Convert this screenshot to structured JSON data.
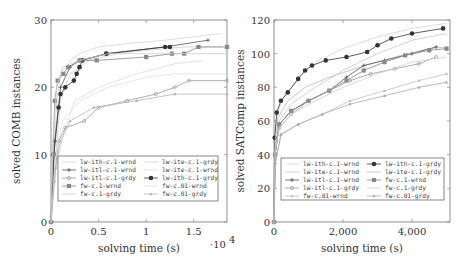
{
  "chart_data": [
    {
      "type": "line",
      "title": "",
      "xlabel": "solving time (s)",
      "ylabel": "solved COMB instances",
      "x_scale_note": "·10^4",
      "xlim": [
        0,
        1.85
      ],
      "ylim": [
        0,
        30
      ],
      "x_ticks": [
        "0",
        "0.5",
        "1",
        "1.5"
      ],
      "y_ticks": [
        "0",
        "10",
        "20",
        "30"
      ],
      "grid": false,
      "legend_position": "lower center inside",
      "legend": [
        "lw-ith-c.1-wrnd",
        "lw-ite-c.1-grdy",
        "lw-itl-c.1-wrnd",
        "lw-ite-c.1-wrnd",
        "lw-itl-c.1-grdy",
        "lw-ith-c.1-grdy",
        "fw-c.1-wrnd",
        "fw-c.01-wrnd",
        "fw-c.1-grdy",
        "fw-c.01-grdy"
      ],
      "x_unit": "x10^4 s",
      "series": [
        {
          "name": "lw-ith-c.1-wrnd",
          "color": "#d6d6d6",
          "marker": "none",
          "points": [
            [
              0,
              0
            ],
            [
              0.03,
              10
            ],
            [
              0.06,
              18
            ],
            [
              0.1,
              22
            ],
            [
              0.2,
              24
            ],
            [
              0.3,
              25
            ],
            [
              0.5,
              26
            ],
            [
              0.8,
              26.5
            ],
            [
              1.2,
              27
            ],
            [
              1.5,
              27.5
            ],
            [
              1.8,
              28
            ]
          ]
        },
        {
          "name": "lw-ite-c.1-grdy",
          "color": "#cfcfcf",
          "marker": "none",
          "points": [
            [
              0,
              0
            ],
            [
              0.05,
              10
            ],
            [
              0.1,
              18
            ],
            [
              0.2,
              22
            ],
            [
              0.4,
              24
            ],
            [
              0.7,
              25
            ],
            [
              1.0,
              25.5
            ],
            [
              1.4,
              26
            ],
            [
              1.8,
              26
            ]
          ]
        },
        {
          "name": "lw-itl-c.1-wrnd",
          "color": "#555555",
          "marker": "plus",
          "points": [
            [
              0,
              0
            ],
            [
              0.04,
              12
            ],
            [
              0.1,
              20
            ],
            [
              0.2,
              23
            ],
            [
              0.3,
              24
            ],
            [
              0.6,
              25
            ],
            [
              1.2,
              26
            ],
            [
              1.65,
              27
            ]
          ]
        },
        {
          "name": "lw-ite-c.1-wrnd",
          "color": "#dcdcdc",
          "marker": "none",
          "points": [
            [
              0,
              0
            ],
            [
              0.05,
              8
            ],
            [
              0.15,
              14
            ],
            [
              0.25,
              18
            ],
            [
              0.5,
              20
            ],
            [
              0.9,
              22
            ],
            [
              1.3,
              23.5
            ],
            [
              1.6,
              24
            ]
          ]
        },
        {
          "name": "lw-itl-c.1-grdy",
          "color": "#9a9a9a",
          "marker": "dot",
          "points": [
            [
              0,
              0
            ],
            [
              0.03,
              6
            ],
            [
              0.08,
              12
            ],
            [
              0.15,
              14
            ],
            [
              0.35,
              15
            ],
            [
              0.5,
              17
            ],
            [
              0.8,
              18
            ],
            [
              1.1,
              19
            ],
            [
              1.3,
              20
            ],
            [
              1.45,
              21
            ],
            [
              1.85,
              21
            ]
          ]
        },
        {
          "name": "lw-ith-c.1-grdy",
          "color": "#333333",
          "marker": "filled-circle",
          "points": [
            [
              0,
              0
            ],
            [
              0.03,
              10
            ],
            [
              0.08,
              17
            ],
            [
              0.1,
              19
            ],
            [
              0.15,
              20
            ],
            [
              0.24,
              21
            ],
            [
              0.27,
              22
            ],
            [
              0.3,
              23
            ],
            [
              0.33,
              24
            ],
            [
              0.58,
              25
            ],
            [
              1.2,
              26
            ],
            [
              1.25,
              26
            ]
          ]
        },
        {
          "name": "fw-c.1-wrnd",
          "color": "#888888",
          "marker": "square",
          "points": [
            [
              0,
              0
            ],
            [
              0.02,
              10
            ],
            [
              0.04,
              18
            ],
            [
              0.07,
              21
            ],
            [
              0.13,
              22
            ],
            [
              0.18,
              23
            ],
            [
              0.3,
              24
            ],
            [
              0.48,
              24
            ],
            [
              1.0,
              24.5
            ],
            [
              1.27,
              25
            ],
            [
              1.4,
              25
            ],
            [
              1.55,
              26
            ],
            [
              1.85,
              26
            ]
          ]
        },
        {
          "name": "fw-c.01-wrnd",
          "color": "#e0e0e0",
          "marker": "none",
          "points": [
            [
              0,
              0
            ],
            [
              0.05,
              10
            ],
            [
              0.12,
              15
            ],
            [
              0.3,
              18
            ],
            [
              0.6,
              20
            ],
            [
              1.0,
              21.5
            ],
            [
              1.3,
              22
            ],
            [
              1.85,
              22
            ]
          ]
        },
        {
          "name": "fw-c.1-grdy",
          "color": "#cccccc",
          "marker": "none",
          "points": [
            [
              0,
              0
            ],
            [
              0.02,
              12
            ],
            [
              0.06,
              20
            ],
            [
              0.12,
              23
            ],
            [
              0.3,
              24
            ],
            [
              0.6,
              25
            ],
            [
              1.0,
              25
            ],
            [
              1.85,
              25
            ]
          ]
        },
        {
          "name": "fw-c.01-grdy",
          "color": "#b5b5b5",
          "marker": "triangle",
          "points": [
            [
              0,
              0
            ],
            [
              0.05,
              8
            ],
            [
              0.1,
              12
            ],
            [
              0.2,
              15
            ],
            [
              0.45,
              17
            ],
            [
              0.9,
              18
            ],
            [
              1.3,
              19
            ],
            [
              1.85,
              19
            ]
          ]
        }
      ]
    },
    {
      "type": "line",
      "title": "",
      "xlabel": "solving time (s)",
      "ylabel": "solved SATComp instances",
      "xlim": [
        0,
        5100
      ],
      "ylim": [
        0,
        120
      ],
      "x_ticks": [
        "0",
        "2,000",
        "4,000"
      ],
      "y_ticks": [
        "0",
        "20",
        "40",
        "60",
        "80",
        "100",
        "120"
      ],
      "grid": false,
      "legend_position": "lower center inside",
      "legend": [
        "lw-ith-c.1-wrnd",
        "lw-ith-c.1-grdy",
        "lw-ite-c.1-wrnd",
        "lw-ite-c.1-grdy",
        "lw-itl-c.1-wrnd",
        "fw-c.1-wrnd",
        "lw-itl-c.1-grdy",
        "fw-c.1-grdy",
        "fw-c.01-wrnd",
        "fw-c.01-grdy"
      ],
      "series": [
        {
          "name": "lw-ith-c.1-wrnd",
          "color": "#d4d4d4",
          "marker": "none",
          "points": [
            [
              0,
              0
            ],
            [
              30,
              50
            ],
            [
              100,
              65
            ],
            [
              300,
              75
            ],
            [
              700,
              85
            ],
            [
              1200,
              95
            ],
            [
              2000,
              103
            ],
            [
              3000,
              110
            ],
            [
              4000,
              115
            ],
            [
              5000,
              118
            ]
          ]
        },
        {
          "name": "lw-ith-c.1-grdy",
          "color": "#333333",
          "marker": "filled-circle",
          "points": [
            [
              0,
              0
            ],
            [
              20,
              50
            ],
            [
              80,
              65
            ],
            [
              200,
              72
            ],
            [
              400,
              77
            ],
            [
              700,
              85
            ],
            [
              900,
              90
            ],
            [
              1100,
              93
            ],
            [
              1500,
              96
            ],
            [
              2100,
              98
            ],
            [
              2700,
              101
            ],
            [
              3000,
              105
            ],
            [
              3400,
              109
            ],
            [
              4000,
              112
            ],
            [
              4900,
              115
            ]
          ]
        },
        {
          "name": "lw-ite-c.1-wrnd",
          "color": "#c8c8c8",
          "marker": "none",
          "points": [
            [
              0,
              0
            ],
            [
              40,
              45
            ],
            [
              150,
              60
            ],
            [
              500,
              70
            ],
            [
              1200,
              80
            ],
            [
              2000,
              90
            ],
            [
              3000,
              100
            ],
            [
              4000,
              108
            ],
            [
              5000,
              112
            ]
          ]
        },
        {
          "name": "lw-ite-c.1-grdy",
          "color": "#bbbbbb",
          "marker": "none",
          "points": [
            [
              0,
              0
            ],
            [
              30,
              48
            ],
            [
              120,
              62
            ],
            [
              400,
              72
            ],
            [
              900,
              80
            ],
            [
              1600,
              86
            ],
            [
              2500,
              92
            ],
            [
              3500,
              98
            ],
            [
              4500,
              103
            ],
            [
              5000,
              104
            ]
          ]
        },
        {
          "name": "lw-itl-c.1-wrnd",
          "color": "#555555",
          "marker": "plus",
          "points": [
            [
              0,
              0
            ],
            [
              30,
              40
            ],
            [
              150,
              58
            ],
            [
              500,
              66
            ],
            [
              1000,
              72
            ],
            [
              1600,
              78
            ],
            [
              2100,
              86
            ],
            [
              2600,
              93
            ],
            [
              3200,
              96
            ],
            [
              4000,
              100
            ],
            [
              4700,
              104
            ]
          ]
        },
        {
          "name": "fw-c.1-wrnd",
          "color": "#888888",
          "marker": "square",
          "points": [
            [
              0,
              0
            ],
            [
              30,
              40
            ],
            [
              150,
              58
            ],
            [
              500,
              66
            ],
            [
              1000,
              72
            ],
            [
              1600,
              78
            ],
            [
              2100,
              84
            ],
            [
              2600,
              90
            ],
            [
              3200,
              95
            ],
            [
              3800,
              99
            ],
            [
              4500,
              102
            ],
            [
              5000,
              103
            ]
          ]
        },
        {
          "name": "lw-itl-c.1-grdy",
          "color": "#999999",
          "marker": "dot",
          "points": [
            [
              0,
              0
            ],
            [
              30,
              40
            ],
            [
              150,
              56
            ],
            [
              500,
              64
            ],
            [
              1000,
              72
            ],
            [
              1600,
              78
            ],
            [
              2200,
              84
            ],
            [
              2800,
              88
            ],
            [
              3500,
              91
            ],
            [
              4200,
              94
            ],
            [
              4700,
              98
            ]
          ]
        },
        {
          "name": "fw-c.1-grdy",
          "color": "#d0d0d0",
          "marker": "none",
          "points": [
            [
              0,
              0
            ],
            [
              30,
              42
            ],
            [
              150,
              56
            ],
            [
              500,
              64
            ],
            [
              1200,
              72
            ],
            [
              2000,
              80
            ],
            [
              3000,
              88
            ],
            [
              4000,
              95
            ],
            [
              5000,
              98
            ]
          ]
        },
        {
          "name": "fw-c.01-wrnd",
          "color": "#c0c0c0",
          "marker": "triangle",
          "points": [
            [
              0,
              0
            ],
            [
              40,
              35
            ],
            [
              200,
              52
            ],
            [
              700,
              58
            ],
            [
              1400,
              64
            ],
            [
              2200,
              72
            ],
            [
              3200,
              78
            ],
            [
              4200,
              84
            ],
            [
              5000,
              88
            ]
          ]
        },
        {
          "name": "fw-c.01-grdy",
          "color": "#aaaaaa",
          "marker": "triangle",
          "points": [
            [
              0,
              0
            ],
            [
              40,
              35
            ],
            [
              200,
              52
            ],
            [
              700,
              58
            ],
            [
              1400,
              64
            ],
            [
              2200,
              70
            ],
            [
              3200,
              75
            ],
            [
              4200,
              80
            ],
            [
              5000,
              83
            ]
          ]
        }
      ]
    }
  ]
}
